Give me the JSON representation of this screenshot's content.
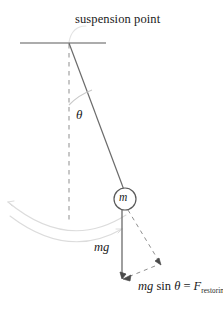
{
  "diagram": {
    "title_label": "suspension point",
    "angle_label": "θ",
    "bob_label": "m",
    "weight_label": "mg",
    "force_expression": {
      "mg": "mg",
      "sin": "sin",
      "theta": "θ",
      "equals": "=",
      "force_symbol": "F",
      "subscript": "restoring"
    },
    "colors": {
      "ink": "#4a4a4a",
      "text": "#1a1a1a",
      "rod": "#6b6b6b",
      "dashed": "#8c8c8c",
      "swing_arc": "#d9d9d9",
      "leader": "#e0e0e0",
      "background": "#ffffff"
    },
    "geometry": {
      "pivot_x": 69,
      "pivot_y": 43,
      "bob_x": 125,
      "bob_y": 199,
      "bob_radius": 11,
      "support_line_x1": 20,
      "support_line_x2": 106,
      "support_line_y": 43,
      "vertical_dash_end_y": 222,
      "weight_arrow_tip_x": 122,
      "weight_arrow_tip_y": 279,
      "tangent_arrow_tip_x": 161,
      "tangent_arrow_tip_y": 265,
      "angle_degrees": 20
    }
  }
}
